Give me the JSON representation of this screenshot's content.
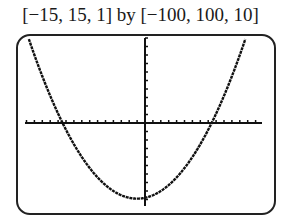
{
  "caption": "[−15, 15, 1] by [−100, 100, 10]",
  "chart_data": {
    "type": "line",
    "title": "[−15, 15, 1] by [−100, 100, 10]",
    "window": {
      "xmin": -15,
      "xmax": 15,
      "xscl": 1,
      "ymin": -100,
      "ymax": 100,
      "yscl": 10
    },
    "xlabel": "",
    "ylabel": "",
    "grid": false,
    "series": [
      {
        "name": "parabola",
        "equation_estimate": "y = x^2 + 2x - 88",
        "x": [
          -15,
          -12,
          -10.4,
          -8,
          -5,
          -1,
          3,
          6,
          8.4,
          10,
          12.5
        ],
        "y": [
          107,
          32,
          0,
          -40,
          -73,
          -89,
          -73,
          -40,
          0,
          32,
          93
        ]
      }
    ],
    "x_intercepts_estimate": [
      -10.4,
      8.4
    ],
    "vertex_estimate": [
      -1,
      -89
    ]
  },
  "colors": {
    "plot": "#111111",
    "frame": "#222222",
    "background": "#ffffff"
  }
}
